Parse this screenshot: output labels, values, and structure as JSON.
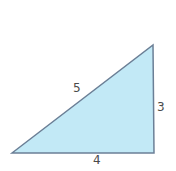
{
  "diagram": {
    "type": "right-triangle",
    "fill_color": "#c2e9f6",
    "stroke_color": "#6b7f96",
    "vertices": [
      [
        12,
        153
      ],
      [
        153,
        45
      ],
      [
        154,
        153
      ]
    ],
    "labels": {
      "hypotenuse": "5",
      "vertical_side": "3",
      "base": "4"
    }
  }
}
